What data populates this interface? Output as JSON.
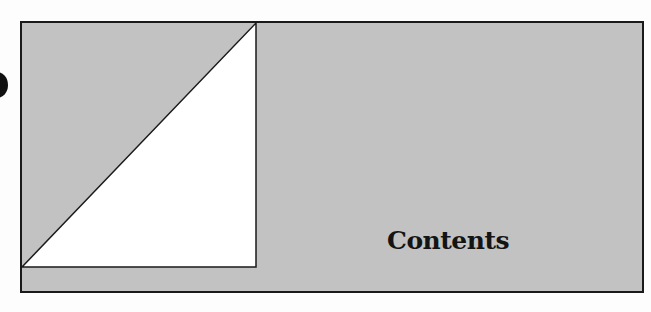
{
  "page": {
    "title": "Contents",
    "colors": {
      "panel_fill": "#c2c2c2",
      "border": "#1a1a1a",
      "triangle_fill": "#ffffff",
      "text": "#141414"
    }
  }
}
